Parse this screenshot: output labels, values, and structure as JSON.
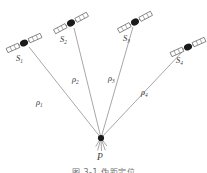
{
  "figure": {
    "type": "diagram",
    "caption": "图 3-1  伪距定位",
    "background_color": "#ffffff",
    "line_color": "#8a8a8a",
    "body_color": "#1a1a1a",
    "panel_color": "#ffffff",
    "panel_stroke": "#555555",
    "text_color": "#3a3a3a"
  },
  "receiver": {
    "label": "P",
    "label_sub": "",
    "x": 101,
    "y": 138,
    "label_x": 97,
    "label_y": 153,
    "dot_radius": 3.1,
    "ticks": [
      {
        "angle_deg": 255,
        "length": 13
      },
      {
        "angle_deg": 272,
        "length": 13
      },
      {
        "angle_deg": 289,
        "length": 13
      },
      {
        "angle_deg": 238,
        "length": 10
      },
      {
        "angle_deg": 306,
        "length": 10
      }
    ]
  },
  "satellites": [
    {
      "name": "satellite-1",
      "label": "S",
      "label_sub": "1",
      "x": 24,
      "y": 43,
      "label_x": 16,
      "label_y": 54,
      "body_rx": 4.1,
      "body_ry": 3.3,
      "wing_angle_deg": 24,
      "wing_len": 13,
      "wing_w": 4.6,
      "stub_len": 6
    },
    {
      "name": "satellite-2",
      "label": "S",
      "label_sub": "2",
      "x": 71,
      "y": 23,
      "label_x": 60,
      "label_y": 35,
      "body_rx": 4.1,
      "body_ry": 3.3,
      "wing_angle_deg": 28,
      "wing_len": 13,
      "wing_w": 4.6,
      "stub_len": 6
    },
    {
      "name": "satellite-3",
      "label": "S",
      "label_sub": "3",
      "x": 135,
      "y": 22,
      "label_x": 123,
      "label_y": 34,
      "body_rx": 4.1,
      "body_ry": 3.3,
      "wing_angle_deg": 28,
      "wing_len": 13,
      "wing_w": 4.6,
      "stub_len": 6
    },
    {
      "name": "satellite-4",
      "label": "S",
      "label_sub": "4",
      "x": 188,
      "y": 47,
      "label_x": 176,
      "label_y": 56,
      "body_rx": 4.1,
      "body_ry": 3.3,
      "wing_angle_deg": 24,
      "wing_len": 13,
      "wing_w": 4.6,
      "stub_len": 6
    }
  ],
  "ranges": [
    {
      "name": "pseudorange-1",
      "label": "ρ",
      "label_sub": "1",
      "from_satellite": 0,
      "x1": 29,
      "y1": 47,
      "x2": 101,
      "y2": 138,
      "label_x": 36,
      "label_y": 98
    },
    {
      "name": "pseudorange-2",
      "label": "ρ",
      "label_sub": "2",
      "from_satellite": 1,
      "x1": 74,
      "y1": 28,
      "x2": 101,
      "y2": 138,
      "label_x": 72,
      "label_y": 75
    },
    {
      "name": "pseudorange-3",
      "label": "ρ",
      "label_sub": "3",
      "from_satellite": 2,
      "x1": 133,
      "y1": 27,
      "x2": 101,
      "y2": 138,
      "label_x": 108,
      "label_y": 74
    },
    {
      "name": "pseudorange-4",
      "label": "ρ",
      "label_sub": "4",
      "from_satellite": 3,
      "x1": 183,
      "y1": 51,
      "x2": 101,
      "y2": 138,
      "label_x": 141,
      "label_y": 88
    }
  ]
}
